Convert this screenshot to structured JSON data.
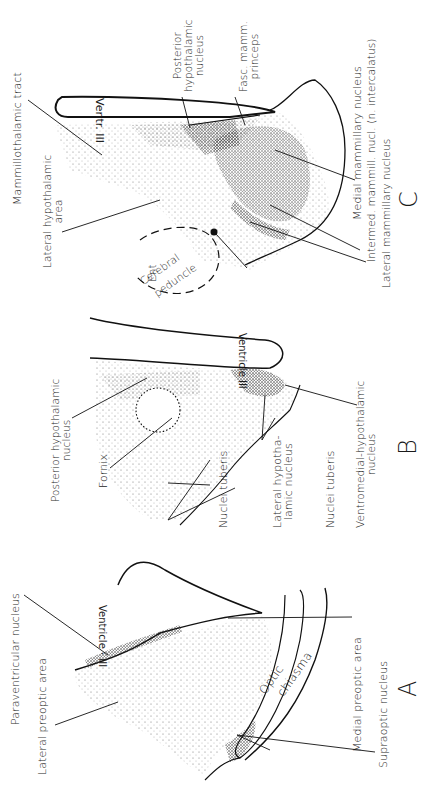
{
  "figure": {
    "orientation": "rotated -90deg (labels read bottom-to-top)",
    "sections": [
      {
        "id": "A",
        "letter": "A",
        "ventricle_label": "Ventricle · III",
        "labels": [
          {
            "key": "paraventricular",
            "text": "Paraventricular nucleus"
          },
          {
            "key": "lateral_preoptic",
            "text": "Lateral preoptic area"
          },
          {
            "key": "optic_chiasma_1",
            "text": "Optic"
          },
          {
            "key": "optic_chiasma_2",
            "text": "chiasma"
          },
          {
            "key": "medial_preoptic",
            "text": "Medial preoptic area"
          },
          {
            "key": "supraoptic",
            "text": "Supraoptic nucleus"
          }
        ]
      },
      {
        "id": "B",
        "letter": "B",
        "ventricle_label": "Ventricle III",
        "labels": [
          {
            "key": "posterior_hypo_1",
            "text": "Posterior hypothalamic"
          },
          {
            "key": "posterior_hypo_2",
            "text": "nucleus"
          },
          {
            "key": "fornix",
            "text": "Fornix"
          },
          {
            "key": "nuclei_tuberis_a",
            "text": "Nuclei tuberis"
          },
          {
            "key": "lateral_hypo_nuc_1",
            "text": "Lateral hypotha-"
          },
          {
            "key": "lateral_hypo_nuc_2",
            "text": "lamic nucleus"
          },
          {
            "key": "nuclei_tuberis_b",
            "text": "Nuclei tuberis"
          },
          {
            "key": "ventromedial_1",
            "text": "Ventromedial-hypothalamic"
          },
          {
            "key": "ventromedial_2",
            "text": "nucleus"
          }
        ]
      },
      {
        "id": "C",
        "letter": "C",
        "ventricle_label": "Ventr. III",
        "labels": [
          {
            "key": "mammillothalamic",
            "text": "Mammillothalamic tract"
          },
          {
            "key": "lateral_hypo_area_1",
            "text": "Lateral hypothalamic"
          },
          {
            "key": "lateral_hypo_area_2",
            "text": "area"
          },
          {
            "key": "cerebral_peduncle_1",
            "text": "Cerebral"
          },
          {
            "key": "cerebral_peduncle_2",
            "text": "peduncle"
          },
          {
            "key": "ent",
            "text": "Ent"
          },
          {
            "key": "posterior_hypo_c_1",
            "text": "Posterior"
          },
          {
            "key": "posterior_hypo_c_2",
            "text": "hypothalamic"
          },
          {
            "key": "posterior_hypo_c_3",
            "text": "nucleus"
          },
          {
            "key": "fasc_mamm_1",
            "text": "Fasc. mamm."
          },
          {
            "key": "fasc_mamm_2",
            "text": "princeps"
          },
          {
            "key": "medial_mammillary",
            "text": "Medial mammillary nucleus"
          },
          {
            "key": "intermed_mammillary",
            "text": "Intermed. mammill. nucl. (n. intercalatus)"
          },
          {
            "key": "lateral_mammillary",
            "text": "Lateral mammillary nucleus"
          }
        ]
      }
    ]
  },
  "colors": {
    "ink": "#111111",
    "background": "#ffffff",
    "stipple": "#333333"
  }
}
